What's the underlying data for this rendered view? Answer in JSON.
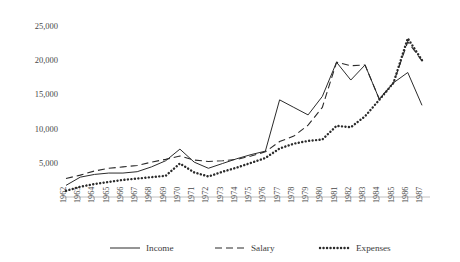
{
  "chart_data": {
    "type": "line",
    "title": "",
    "subtitle": "",
    "xlabel": "",
    "ylabel": "",
    "grid": false,
    "legend_position": "bottom",
    "ylim": [
      0,
      25000
    ],
    "y_ticks": [
      5000,
      10000,
      15000,
      20000,
      25000
    ],
    "y_tick_labels": [
      "5,000",
      "10,000",
      "15,000",
      "20,000",
      "25,000"
    ],
    "x": [
      "1962",
      "1963",
      "1964",
      "1965",
      "1966",
      "1967",
      "1968",
      "1969",
      "1970",
      "1971",
      "1972",
      "1973",
      "1974",
      "1975",
      "1976",
      "1977",
      "1978",
      "1979",
      "1980",
      "1981",
      "1982",
      "1983",
      "1984",
      "1985",
      "1986",
      "1987"
    ],
    "categories": [
      "1962",
      "1963",
      "1964",
      "1965",
      "1966",
      "1967",
      "1968",
      "1969",
      "1970",
      "1971",
      "1972",
      "1973",
      "1974",
      "1975",
      "1976",
      "1977",
      "1978",
      "1979",
      "1980",
      "1981",
      "1982",
      "1983",
      "1984",
      "1985",
      "1986",
      "1987"
    ],
    "series": [
      {
        "name": "Income",
        "style": "solid",
        "color": "#2b2b2b",
        "values": [
          1700,
          2900,
          3300,
          3500,
          3500,
          3700,
          4400,
          5300,
          7000,
          5100,
          4200,
          4900,
          5600,
          6200,
          6700,
          14200,
          13100,
          12000,
          14700,
          19700,
          17100,
          19300,
          14300,
          16700,
          18200,
          13400
        ]
      },
      {
        "name": "Salary",
        "style": "dashed",
        "color": "#2b2b2b",
        "values": [
          2700,
          3200,
          3800,
          4200,
          4400,
          4600,
          5100,
          5500,
          6000,
          5400,
          5200,
          5300,
          5500,
          6000,
          6600,
          8100,
          8900,
          10500,
          13100,
          19700,
          19200,
          19300,
          14300,
          16700,
          22700,
          19900
        ]
      },
      {
        "name": "Expenses",
        "style": "dotted",
        "color": "#2b2b2b",
        "values": [
          900,
          1500,
          1900,
          2200,
          2500,
          2700,
          2900,
          3100,
          4900,
          3600,
          3000,
          3700,
          4300,
          5000,
          5700,
          7100,
          7800,
          8200,
          8400,
          10400,
          10200,
          11800,
          14200,
          16700,
          23200,
          20000
        ]
      }
    ],
    "legend": [
      {
        "label": "Income",
        "style": "solid"
      },
      {
        "label": "Salary",
        "style": "dashed"
      },
      {
        "label": "Expenses",
        "style": "dotted"
      }
    ]
  }
}
